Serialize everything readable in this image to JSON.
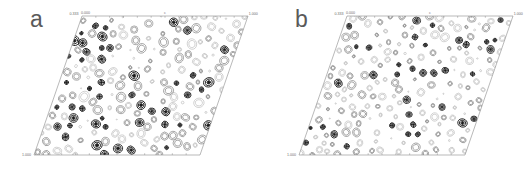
{
  "figure": {
    "type": "contour-map-pair",
    "background": "#ffffff",
    "panels": [
      {
        "id": "a",
        "letter": "a",
        "cell_shape": "parallelogram",
        "corner_labels": {
          "top_left_a": "0.333",
          "top_left_b": "0.000",
          "top_right": "1.000",
          "bottom_left": "1.000"
        },
        "axis_labels": {
          "top_center": "c"
        },
        "tick_count_top": 12,
        "tick_count_bottom": 12,
        "geometry": {
          "top_left_x": 82,
          "top_left_y": 16,
          "top_right_x": 248,
          "top_right_y": 16,
          "bottom_right_x": 200,
          "bottom_right_y": 155,
          "bottom_left_x": 34,
          "bottom_left_y": 155
        },
        "blob_style": "dense-dark-contour-rings",
        "blob_count": 186,
        "mean_blob_radius": 3.3,
        "dark_fraction": 0.34
      },
      {
        "id": "b",
        "letter": "b",
        "cell_shape": "parallelogram",
        "corner_labels": {
          "top_left_a": "0.333",
          "top_left_b": "0.000",
          "top_right": "1.000",
          "bottom_left": "1.000"
        },
        "axis_labels": {
          "top_center": "c"
        },
        "tick_count_top": 12,
        "tick_count_bottom": 12,
        "geometry": {
          "top_left_x": 82,
          "top_left_y": 16,
          "top_right_x": 248,
          "top_right_y": 16,
          "bottom_right_x": 200,
          "bottom_right_y": 155,
          "bottom_left_x": 34,
          "bottom_left_y": 155
        },
        "blob_style": "sparse-light-contour-rings",
        "blob_count": 198,
        "mean_blob_radius": 2.8,
        "dark_fraction": 0.18
      }
    ],
    "colors": {
      "edge": "#8a8a8a",
      "label": "#6b6b6b",
      "letter": "#5a5a5a",
      "blob_dark": "#1a1a1a",
      "blob_mid": "#6e6e6e",
      "blob_light": "#b4b4b4"
    }
  }
}
